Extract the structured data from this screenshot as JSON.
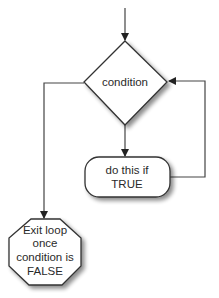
{
  "diagram": {
    "type": "flowchart",
    "title": "",
    "nodes": {
      "condition": {
        "shape": "diamond",
        "label": "condition"
      },
      "action": {
        "shape": "rounded-rect",
        "line1": "do this if",
        "line2": "TRUE"
      },
      "exit": {
        "shape": "octagon",
        "line1": "Exit loop",
        "line2": "once",
        "line3": "condition is",
        "line4": "FALSE"
      }
    },
    "edges": [
      {
        "from": "entry",
        "to": "condition",
        "label": ""
      },
      {
        "from": "condition",
        "to": "action",
        "label": ""
      },
      {
        "from": "action",
        "to": "condition",
        "label": ""
      },
      {
        "from": "condition",
        "to": "exit",
        "label": ""
      }
    ],
    "colors": {
      "stroke": "#333333",
      "fill": "#ffffff",
      "text": "#2a2a2a",
      "shadow": "#999999"
    }
  }
}
